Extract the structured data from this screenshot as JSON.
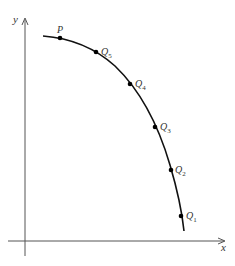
{
  "diagram": {
    "axes": {
      "x_label": "x",
      "y_label": "y",
      "color": "#555555"
    },
    "curve": {
      "color": "#111111",
      "description": "decreasing concave-down curve from upper-left to lower-right"
    },
    "points": [
      {
        "label": "P",
        "sub": "",
        "x": 60,
        "y": 38
      },
      {
        "label": "Q",
        "sub": "5",
        "x": 96,
        "y": 52
      },
      {
        "label": "Q",
        "sub": "4",
        "x": 130,
        "y": 84
      },
      {
        "label": "Q",
        "sub": "3",
        "x": 155,
        "y": 127
      },
      {
        "label": "Q",
        "sub": "2",
        "x": 171,
        "y": 170
      },
      {
        "label": "Q",
        "sub": "1",
        "x": 181,
        "y": 216
      }
    ]
  }
}
